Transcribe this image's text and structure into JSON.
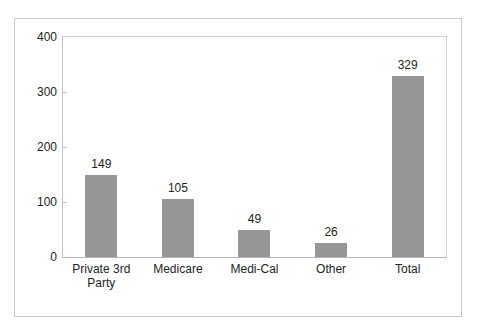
{
  "clipped_header_text": "",
  "chart_data": {
    "type": "bar",
    "title": "",
    "subtitle": "",
    "xlabel": "",
    "ylabel": "",
    "categories": [
      "Private 3rd Party",
      "Medicare",
      "Medi-Cal",
      "Other",
      "Total"
    ],
    "category_lines": [
      [
        "Private 3rd",
        "Party"
      ],
      [
        "Medicare"
      ],
      [
        "Medi-Cal"
      ],
      [
        "Other"
      ],
      [
        "Total"
      ]
    ],
    "values": [
      149,
      105,
      49,
      26,
      329
    ],
    "value_labels": [
      "149",
      "105",
      "49",
      "26",
      "329"
    ],
    "ylim": [
      0,
      400
    ],
    "yticks": [
      0,
      100,
      200,
      300,
      400
    ],
    "ytick_labels": [
      "0",
      "100",
      "200",
      "300",
      "400"
    ],
    "grid": false,
    "legend": null,
    "legend_position": "none",
    "series": [
      {
        "name": "Count",
        "values": [
          149,
          105,
          49,
          26,
          329
        ]
      }
    ],
    "colors": {
      "bar_fill": "#969696",
      "text": "#231f20",
      "plot_border": "#d2d2d4",
      "figure_border": "#c9c9cb",
      "axis_line": "#b5b5b7",
      "background": "#ffffff"
    }
  }
}
